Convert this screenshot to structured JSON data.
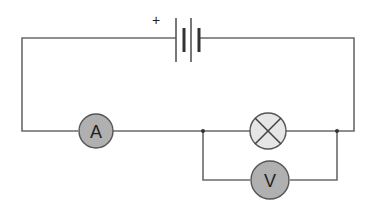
{
  "diagram": {
    "type": "circuit",
    "battery": {
      "polarity_label": "+"
    },
    "ammeter": {
      "label": "A",
      "fill": "#b0b0b0"
    },
    "lamp": {
      "fill": "#e6e6e6"
    },
    "voltmeter": {
      "label": "V",
      "fill": "#b0b0b0"
    },
    "colors": {
      "wire": "#6a6a6a",
      "meter_stroke": "#555555"
    }
  }
}
